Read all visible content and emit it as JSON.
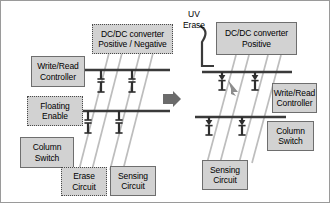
{
  "figure": {
    "panels": [
      {
        "id": "left",
        "description": "Electrical erase configuration with positive / negative DC-DC converter and erase circuit"
      },
      {
        "id": "right",
        "description": "UV erase configuration with positive-only DC-DC converter, erase circuit removed"
      }
    ],
    "transition_icon": "right-arrow-icon"
  },
  "colors": {
    "box_fill": "#d2d2d2",
    "box_border_solid": "#6e6e6e",
    "box_border_dotted": "#4a4a4a",
    "wire_dark": "#3a3a3a",
    "wire_light": "#b9b9b9",
    "frame": "#9a9a9a",
    "background": "#ffffff"
  },
  "left_panel": {
    "dcdc": {
      "line1": "DC/DC converter",
      "line2": "Positive / Negative"
    },
    "write_read": {
      "line1": "Write/Read",
      "line2": "Controller"
    },
    "floating": {
      "line1": "Floating",
      "line2": "Enable"
    },
    "column_switch": {
      "line1": "Column",
      "line2": "Switch"
    },
    "erase": {
      "line1": "Erase",
      "line2": "Circuit"
    },
    "sensing": {
      "line1": "Sensing",
      "line2": "Circuit"
    }
  },
  "right_panel": {
    "uv_erase": {
      "line1": "UV",
      "line2": "Erase"
    },
    "dcdc": {
      "line1": "DC/DC converter",
      "line2": "Positive"
    },
    "write_read": {
      "line1": "Write/Read",
      "line2": "Controller"
    },
    "column_switch": {
      "line1": "Column",
      "line2": "Switch"
    },
    "sensing": {
      "line1": "Sensing",
      "line2": "Circuit"
    }
  }
}
